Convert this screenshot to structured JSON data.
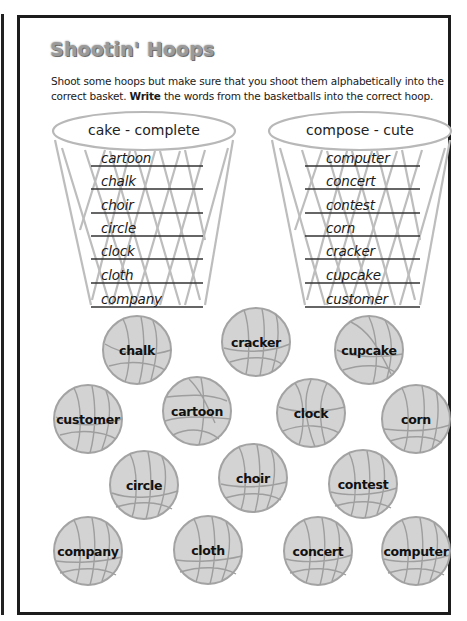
{
  "worksheet": {
    "title": "Shootin' Hoops",
    "instructions_line1": "Shoot some hoops but make sure that you shoot them alphabetically into the",
    "instructions_line2_pre": "correct basket. ",
    "instructions_line2_bold": "Write",
    "instructions_line2_post": " the words from the basketballs into the correct hoop."
  },
  "hoops": [
    {
      "range_label": "cake - complete",
      "answers": [
        "cartoon",
        "chalk",
        "choir",
        "circle",
        "clock",
        "cloth",
        "company"
      ]
    },
    {
      "range_label": "compose - cute",
      "answers": [
        "computer",
        "concert",
        "contest",
        "corn",
        "cracker",
        "cupcake",
        "customer"
      ]
    }
  ],
  "basketballs": [
    {
      "word": "chalk"
    },
    {
      "word": "cracker"
    },
    {
      "word": "cupcake"
    },
    {
      "word": "customer"
    },
    {
      "word": "cartoon"
    },
    {
      "word": "clock"
    },
    {
      "word": "corn"
    },
    {
      "word": "circle"
    },
    {
      "word": "choir"
    },
    {
      "word": "contest"
    },
    {
      "word": "company"
    },
    {
      "word": "cloth"
    },
    {
      "word": "concert"
    },
    {
      "word": "computer"
    }
  ],
  "colors": {
    "ball_fill": "#d3d3d3",
    "ball_stroke": "#a3a3a3",
    "net": "#bdbdbd",
    "title": "#9a9a9a"
  }
}
